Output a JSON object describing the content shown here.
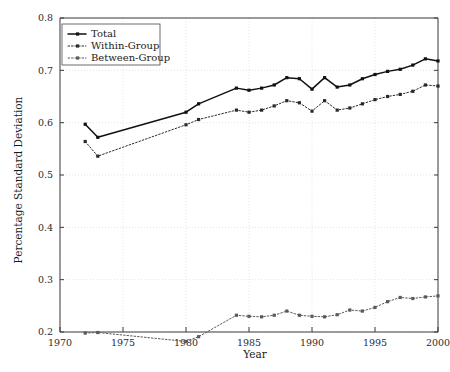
{
  "chart_data": {
    "type": "line",
    "title": "",
    "xlabel": "Year",
    "ylabel": "Percentage Standard Deviation",
    "xlim": [
      1970,
      2000
    ],
    "ylim": [
      0.2,
      0.8
    ],
    "xticks": [
      1970,
      1975,
      1980,
      1985,
      1990,
      1995,
      2000
    ],
    "yticks": [
      0.2,
      0.3,
      0.4,
      0.5,
      0.6,
      0.7,
      0.8
    ],
    "xtick_labels": [
      "1970",
      "1975",
      "1980",
      "1985",
      "1990",
      "1995",
      "2000"
    ],
    "ytick_labels": [
      "0.2",
      "0.3",
      "0.4",
      "0.5",
      "0.6",
      "0.7",
      "0.8"
    ],
    "grid": true,
    "legend_position": "upper left",
    "x": [
      1972,
      1973,
      1980,
      1981,
      1984,
      1985,
      1986,
      1987,
      1988,
      1989,
      1990,
      1991,
      1992,
      1993,
      1994,
      1995,
      1996,
      1997,
      1998,
      1999,
      2000
    ],
    "series": [
      {
        "name": "Total",
        "color": "#111111",
        "dash": "solid",
        "values": [
          0.597,
          0.572,
          0.62,
          0.636,
          0.666,
          0.662,
          0.666,
          0.672,
          0.686,
          0.684,
          0.664,
          0.686,
          0.668,
          0.672,
          0.684,
          0.692,
          0.698,
          0.702,
          0.71,
          0.722,
          0.718
        ]
      },
      {
        "name": "Within-Group",
        "color": "#2a2a2a",
        "dash": "dotted",
        "values": [
          0.564,
          0.536,
          0.596,
          0.606,
          0.624,
          0.62,
          0.624,
          0.632,
          0.642,
          0.638,
          0.622,
          0.642,
          0.624,
          0.628,
          0.636,
          0.644,
          0.65,
          0.654,
          0.66,
          0.672,
          0.67
        ]
      },
      {
        "name": "Between-Group",
        "color": "#5a5a5a",
        "dash": "dotted",
        "values": [
          0.198,
          0.199,
          0.182,
          0.191,
          0.232,
          0.23,
          0.229,
          0.232,
          0.24,
          0.232,
          0.23,
          0.229,
          0.233,
          0.242,
          0.24,
          0.247,
          0.258,
          0.266,
          0.264,
          0.267,
          0.269
        ]
      }
    ]
  },
  "legend": {
    "items": [
      {
        "label": "Total"
      },
      {
        "label": "Within-Group"
      },
      {
        "label": "Between-Group"
      }
    ]
  },
  "axes": {
    "x_title": "Year",
    "y_title": "Percentage Standard Deviation"
  }
}
